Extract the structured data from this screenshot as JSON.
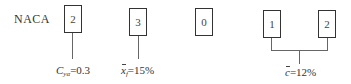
{
  "diagram": {
    "title_prefix": "NACA",
    "digits": [
      {
        "value": "2",
        "meaning": "design lift coefficient"
      },
      {
        "value": "3",
        "meaning": "max camber position"
      },
      {
        "value": "0",
        "meaning": "reflex indicator"
      },
      {
        "value": "1",
        "meaning": "thickness (tens)"
      },
      {
        "value": "2",
        "meaning": "thickness (units)"
      }
    ],
    "annotations": {
      "lift": {
        "symbol": "C",
        "subscript": "yα",
        "value": "=0.3"
      },
      "camber_position": {
        "symbol": "x",
        "subscript": "f",
        "value": "=15%"
      },
      "thickness": {
        "symbol": "c",
        "value": "=12%"
      }
    },
    "colors": {
      "box_border": "#333333",
      "connector": "#666666",
      "text": "#333333",
      "background": "#ffffff"
    }
  }
}
